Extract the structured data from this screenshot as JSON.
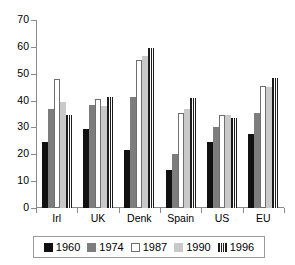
{
  "chart_data": {
    "type": "bar",
    "title": "",
    "subtitle": "",
    "xlabel": "",
    "ylabel": "",
    "ylim": [
      0,
      70
    ],
    "yticks": [
      0,
      10,
      20,
      30,
      40,
      50,
      60,
      70
    ],
    "ytick_labels": [
      "0",
      "10",
      "20",
      "30",
      "40",
      "50",
      "60",
      "70"
    ],
    "grid": false,
    "legend_position": "bottom",
    "categories": [
      "Irl",
      "UK",
      "Denk",
      "Spain",
      "US",
      "EU"
    ],
    "series": [
      {
        "name": "1960",
        "color": "#111111",
        "values": [
          24.5,
          29.5,
          21.5,
          14.0,
          24.5,
          27.5
        ]
      },
      {
        "name": "1974",
        "color": "#7d7d7d",
        "values": [
          37.0,
          38.5,
          41.5,
          20.0,
          30.0,
          35.5
        ]
      },
      {
        "name": "1987",
        "color": "#ffffff",
        "values": [
          48.0,
          40.5,
          55.0,
          35.5,
          34.5,
          45.5
        ]
      },
      {
        "name": "1990",
        "color": "#c9c9c9",
        "values": [
          39.5,
          38.0,
          56.5,
          37.0,
          34.5,
          45.0
        ]
      },
      {
        "name": "1996",
        "color": "#1c1c1c",
        "values": [
          34.5,
          41.5,
          59.5,
          41.0,
          33.5,
          48.5
        ]
      }
    ]
  },
  "legend": {
    "items": [
      {
        "label": "1960",
        "swatch": "legend-swatch-1960"
      },
      {
        "label": "1974",
        "swatch": "legend-swatch-1974"
      },
      {
        "label": "1987",
        "swatch": "legend-swatch-1987"
      },
      {
        "label": "1990",
        "swatch": "legend-swatch-1990"
      },
      {
        "label": "1996",
        "swatch": "legend-swatch-1996"
      }
    ]
  }
}
